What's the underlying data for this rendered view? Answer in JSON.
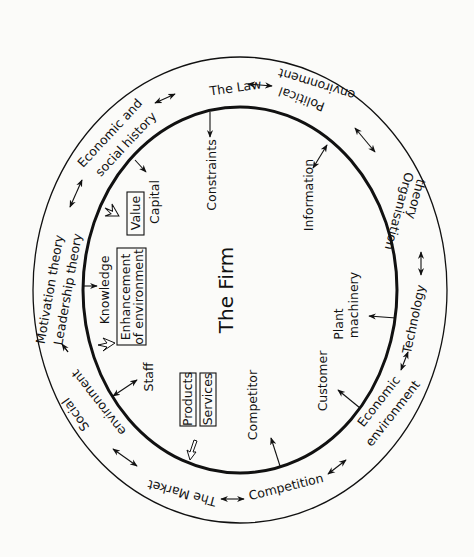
{
  "diagram": {
    "title": "The Firm",
    "outer_ring": {
      "the_law": "The Law",
      "political_1": "Political",
      "political_2": "environment",
      "organisation_1": "Organisation",
      "organisation_2": "theory",
      "technology": "Technology",
      "economic_env_1": "Economic",
      "economic_env_2": "environment",
      "competition": "Competition",
      "the_market": "The Market",
      "social_1": "Social",
      "social_2": "environment",
      "motivation": "Motivation theory",
      "leadership": "Leadership theory",
      "econ_social_1": "Economic and",
      "econ_social_2": "social history"
    },
    "inner": {
      "constraints": "Constraints",
      "information": "Information",
      "capital": "Capital",
      "value": "Value",
      "knowledge": "Knowledge",
      "enhancement_1": "Enhancement",
      "enhancement_2": "of environment",
      "staff": "Staff",
      "products": "Products",
      "services": "Services",
      "competitor": "Competitor",
      "customer": "Customer",
      "plant_1": "Plant",
      "plant_2": "machinery"
    },
    "colors": {
      "stroke": "#111111",
      "background": "#fbfbf9"
    }
  }
}
